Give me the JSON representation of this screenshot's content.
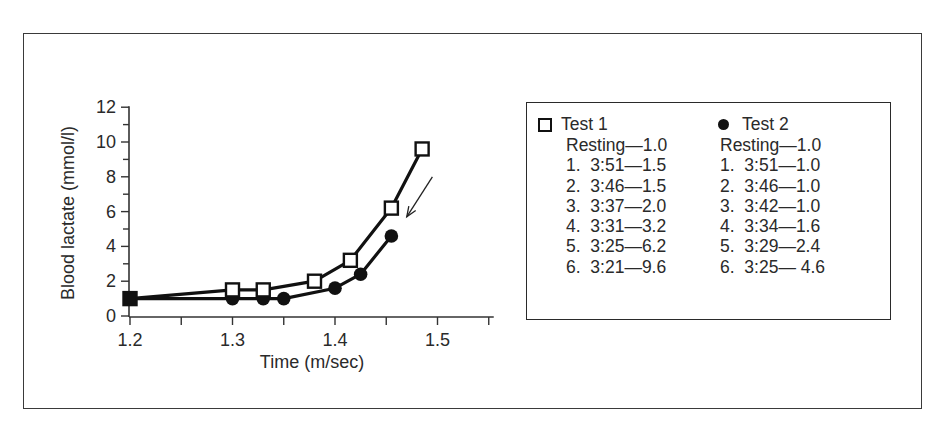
{
  "chart_data": {
    "type": "line",
    "title": "",
    "xlabel": "Time (m/sec)",
    "ylabel": "Blood lactate (mmol/l)",
    "xlim": [
      1.2,
      1.55
    ],
    "ylim": [
      0,
      12
    ],
    "x_ticks": [
      1.2,
      1.25,
      1.3,
      1.35,
      1.4,
      1.45,
      1.5,
      1.55
    ],
    "x_tick_labels": [
      "1.2",
      "",
      "1.3",
      "",
      "1.4",
      "",
      "1.5",
      ""
    ],
    "y_ticks": [
      0,
      1,
      2,
      3,
      4,
      5,
      6,
      7,
      8,
      9,
      10,
      11,
      12
    ],
    "y_tick_labels": [
      "0",
      "",
      "2",
      "",
      "4",
      "",
      "6",
      "",
      "8",
      "",
      "10",
      "",
      "12"
    ],
    "grid": false,
    "legend_position": "right (boxed, outside plot)",
    "series": [
      {
        "name": "Test 1",
        "marker": "open-square",
        "x": [
          1.2,
          1.3,
          1.33,
          1.38,
          1.415,
          1.455,
          1.485
        ],
        "y": [
          1.0,
          1.5,
          1.5,
          2.0,
          3.2,
          6.2,
          9.6
        ]
      },
      {
        "name": "Test 2",
        "marker": "filled-circle",
        "x": [
          1.2,
          1.3,
          1.33,
          1.35,
          1.4,
          1.425,
          1.455
        ],
        "y": [
          1.0,
          1.0,
          1.0,
          1.0,
          1.6,
          2.4,
          4.6
        ]
      }
    ],
    "annotations": [
      {
        "type": "arrow",
        "from": [
          1.495,
          8.0
        ],
        "to": [
          1.47,
          5.7
        ],
        "description": "arrow pointing from Test 1 curve down toward Test 2 curve (rightward shift)"
      }
    ]
  },
  "legend": {
    "test1": {
      "title": "Test 1",
      "rows": [
        "Resting—1.0",
        "1.  3:51—1.5",
        "2.  3:46—1.5",
        "3.  3:37—2.0",
        "4.  3:31—3.2",
        "5.  3:25—6.2",
        "6.  3:21—9.6"
      ]
    },
    "test2": {
      "title": "Test 2",
      "rows": [
        "Resting—1.0",
        "1.  3:51—1.0",
        "2.  3:46—1.0",
        "3.  3:42—1.0",
        "4.  3:34—1.6",
        "5.  3:29—2.4",
        "6.  3:25— 4.6"
      ]
    }
  },
  "colors": {
    "ink": "#111111",
    "text": "#2a2a2a",
    "frame": "#3a3a3a",
    "background": "#ffffff"
  }
}
